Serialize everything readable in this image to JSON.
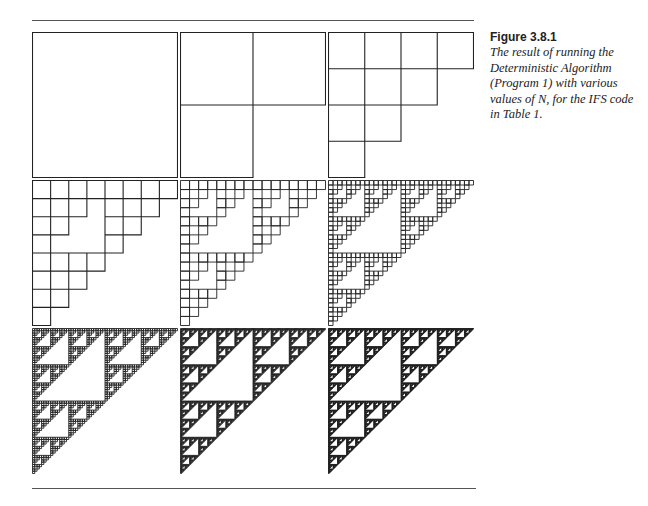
{
  "figure": {
    "label": "Figure 3.8.1",
    "caption": "The result of running the Deterministic Algorithm (Program 1) with various values of N, for the IFS code in Table 1."
  },
  "chart_data": {
    "type": "diagram",
    "title": "Figure 3.8.1",
    "layout": {
      "rows": 3,
      "cols": 3,
      "panel_size_px": 146
    },
    "panels": [
      {
        "index": 1,
        "iteration": 0,
        "grid": 1
      },
      {
        "index": 2,
        "iteration": 1,
        "grid": 2
      },
      {
        "index": 3,
        "iteration": 2,
        "grid": 4
      },
      {
        "index": 4,
        "iteration": 3,
        "grid": 8
      },
      {
        "index": 5,
        "iteration": 4,
        "grid": 16
      },
      {
        "index": 6,
        "iteration": 5,
        "grid": 32
      },
      {
        "index": 7,
        "iteration": 6,
        "grid": 64
      },
      {
        "index": 8,
        "iteration": 7,
        "grid": 128
      },
      {
        "index": 9,
        "iteration": 8,
        "grid": 256
      }
    ],
    "colors": {
      "stroke": "#222222",
      "background": "#ffffff"
    }
  }
}
